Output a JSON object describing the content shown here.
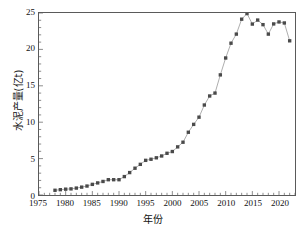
{
  "chart_data": {
    "type": "line",
    "title": "",
    "xlabel": "年份",
    "ylabel": "水泥产量(亿t)",
    "xlim": [
      1975,
      2023
    ],
    "ylim": [
      0,
      25
    ],
    "xticks": [
      1975,
      1980,
      1985,
      1990,
      1995,
      2000,
      2005,
      2010,
      2015,
      2020
    ],
    "yticks": [
      0,
      5,
      10,
      15,
      20,
      25
    ],
    "xminor_step": 1,
    "yminor_step": 1,
    "grid": false,
    "legend": null,
    "marker": "square",
    "marker_color": "#4a4a4a",
    "line_color": "#8a8a8a",
    "x": [
      1978,
      1979,
      1980,
      1981,
      1982,
      1983,
      1984,
      1985,
      1986,
      1987,
      1988,
      1989,
      1990,
      1991,
      1992,
      1993,
      1994,
      1995,
      1996,
      1997,
      1998,
      1999,
      2000,
      2001,
      2002,
      2003,
      2004,
      2005,
      2006,
      2007,
      2008,
      2009,
      2010,
      2011,
      2012,
      2013,
      2014,
      2015,
      2016,
      2017,
      2018,
      2019,
      2020,
      2021,
      2022
    ],
    "values": [
      0.65,
      0.73,
      0.8,
      0.84,
      0.95,
      1.08,
      1.23,
      1.46,
      1.66,
      1.86,
      2.1,
      2.1,
      2.1,
      2.53,
      3.08,
      3.68,
      4.21,
      4.76,
      4.91,
      5.11,
      5.36,
      5.73,
      5.97,
      6.61,
      7.25,
      8.62,
      9.7,
      10.69,
      12.36,
      13.6,
      14.0,
      16.5,
      18.82,
      20.85,
      22.1,
      24.15,
      24.92,
      23.48,
      24.03,
      23.4,
      22.1,
      23.5,
      23.77,
      23.63,
      21.18
    ]
  }
}
